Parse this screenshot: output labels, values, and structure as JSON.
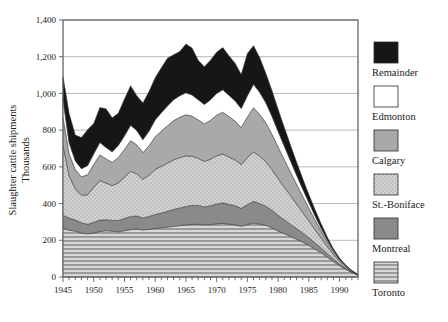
{
  "chart_data": {
    "type": "area",
    "stacked": true,
    "title": "",
    "xlabel": "",
    "ylabel": "Slaughter cattle shipments",
    "ylabel_line2": "Thousands",
    "ylim": [
      0,
      1400
    ],
    "ytick_step": 200,
    "ytick_labels": [
      "0",
      "200",
      "400",
      "600",
      "800",
      "1,000",
      "1,200",
      "1,400"
    ],
    "ytick_values": [
      0,
      200,
      400,
      600,
      800,
      1000,
      1200,
      1400
    ],
    "xlim": [
      1945,
      1993
    ],
    "xtick_labels": [
      "1945",
      "1950",
      "1955",
      "1960",
      "1965",
      "1970",
      "1975",
      "1980",
      "1985",
      "1990"
    ],
    "xtick_values": [
      1945,
      1950,
      1955,
      1960,
      1965,
      1970,
      1975,
      1980,
      1985,
      1990
    ],
    "xtick_minor_step": 1,
    "grid": "horizontal",
    "legend_position": "right",
    "x": [
      1945,
      1946,
      1947,
      1948,
      1949,
      1950,
      1951,
      1952,
      1953,
      1954,
      1955,
      1956,
      1957,
      1958,
      1959,
      1960,
      1961,
      1962,
      1963,
      1964,
      1965,
      1966,
      1967,
      1968,
      1969,
      1970,
      1971,
      1972,
      1973,
      1974,
      1975,
      1976,
      1977,
      1978,
      1979,
      1980,
      1981,
      1982,
      1983,
      1984,
      1985,
      1986,
      1987,
      1988,
      1989,
      1990,
      1991,
      1992,
      1993
    ],
    "series": [
      {
        "name": "Toronto",
        "color": "#c8c8c8",
        "pattern": "horizontal-lines",
        "values": [
          265,
          255,
          250,
          240,
          235,
          240,
          248,
          252,
          250,
          246,
          252,
          258,
          262,
          256,
          260,
          265,
          268,
          272,
          276,
          280,
          284,
          286,
          288,
          284,
          286,
          290,
          292,
          288,
          284,
          276,
          286,
          294,
          288,
          282,
          268,
          250,
          236,
          222,
          206,
          190,
          172,
          152,
          132,
          108,
          84,
          62,
          42,
          24,
          10
        ]
      },
      {
        "name": "Montreal",
        "color": "#8a8a8a",
        "pattern": "solid",
        "values": [
          72,
          66,
          60,
          56,
          52,
          58,
          62,
          60,
          58,
          62,
          66,
          72,
          70,
          66,
          70,
          76,
          80,
          86,
          92,
          96,
          100,
          104,
          102,
          98,
          102,
          108,
          112,
          108,
          104,
          98,
          108,
          118,
          112,
          104,
          96,
          86,
          76,
          66,
          58,
          50,
          42,
          34,
          26,
          20,
          14,
          9,
          5,
          3,
          1
        ]
      },
      {
        "name": "St.-Boniface",
        "color": "#cfcfcf",
        "pattern": "dots",
        "values": [
          380,
          230,
          170,
          150,
          160,
          190,
          215,
          200,
          190,
          205,
          225,
          245,
          230,
          210,
          225,
          245,
          255,
          262,
          270,
          274,
          276,
          268,
          256,
          248,
          254,
          262,
          266,
          258,
          250,
          238,
          256,
          270,
          258,
          242,
          222,
          200,
          178,
          156,
          134,
          112,
          92,
          72,
          54,
          38,
          24,
          14,
          8,
          4,
          1
        ]
      },
      {
        "name": "Calgary",
        "color": "#a9a9a9",
        "pattern": "solid",
        "values": [
          155,
          120,
          105,
          100,
          110,
          125,
          140,
          132,
          126,
          138,
          152,
          168,
          158,
          146,
          160,
          178,
          192,
          204,
          214,
          220,
          224,
          218,
          210,
          204,
          212,
          222,
          228,
          220,
          212,
          202,
          222,
          240,
          228,
          212,
          192,
          172,
          150,
          128,
          108,
          88,
          70,
          54,
          38,
          26,
          16,
          9,
          5,
          2,
          1
        ]
      },
      {
        "name": "Edmonton",
        "color": "#ffffff",
        "pattern": "solid",
        "values": [
          95,
          60,
          48,
          44,
          50,
          58,
          68,
          62,
          58,
          66,
          74,
          84,
          78,
          70,
          80,
          92,
          100,
          108,
          114,
          118,
          120,
          116,
          110,
          106,
          112,
          118,
          122,
          116,
          110,
          104,
          116,
          128,
          120,
          110,
          98,
          86,
          74,
          62,
          50,
          40,
          30,
          22,
          16,
          10,
          6,
          3,
          2,
          1,
          0
        ]
      },
      {
        "name": "Remainder",
        "color": "#161616",
        "pattern": "solid",
        "values": [
          125,
          160,
          140,
          170,
          195,
          165,
          190,
          210,
          185,
          175,
          200,
          215,
          190,
          200,
          215,
          230,
          245,
          260,
          245,
          240,
          265,
          255,
          215,
          205,
          215,
          225,
          230,
          215,
          205,
          185,
          230,
          210,
          190,
          160,
          140,
          120,
          102,
          86,
          70,
          56,
          44,
          34,
          24,
          16,
          10,
          6,
          3,
          1,
          0
        ]
      }
    ]
  },
  "legend": {
    "entries": [
      {
        "label": "Remainder"
      },
      {
        "label": "Edmonton"
      },
      {
        "label": "Calgary"
      },
      {
        "label": "St.-Boniface"
      },
      {
        "label": "Montreal"
      },
      {
        "label": "Toronto"
      }
    ]
  }
}
